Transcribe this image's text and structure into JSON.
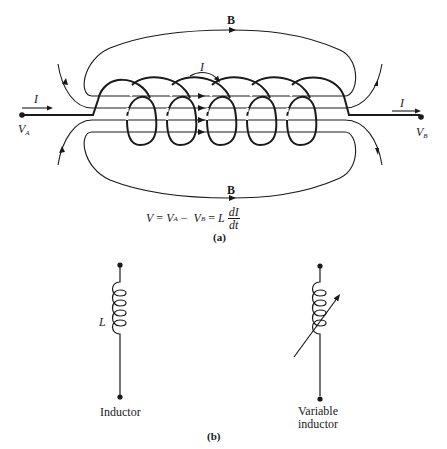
{
  "figure": {
    "part_a": {
      "field_label_top": "B",
      "field_label_bottom": "B",
      "current_label_coil": "I",
      "current_label_in": "I",
      "current_label_out": "I",
      "terminal_a": {
        "main": "V",
        "sub": "A"
      },
      "terminal_b": {
        "main": "V",
        "sub": "B"
      },
      "equation": {
        "lhs": "V",
        "eq1": "=",
        "va": "V",
        "va_sub": "A",
        "minus": "−",
        "vb": "V",
        "vb_sub": "B",
        "eq2": "=",
        "coef": "L",
        "num": "dI",
        "den": "dt"
      },
      "caption": "(a)"
    },
    "part_b": {
      "inductor_symbol_label": "L",
      "inductor_caption": "Inductor",
      "variable_caption_line1": "Variable",
      "variable_caption_line2": "inductor",
      "caption": "(b)"
    },
    "colors": {
      "ink": "#1a1a1a",
      "background": "#ffffff"
    }
  }
}
